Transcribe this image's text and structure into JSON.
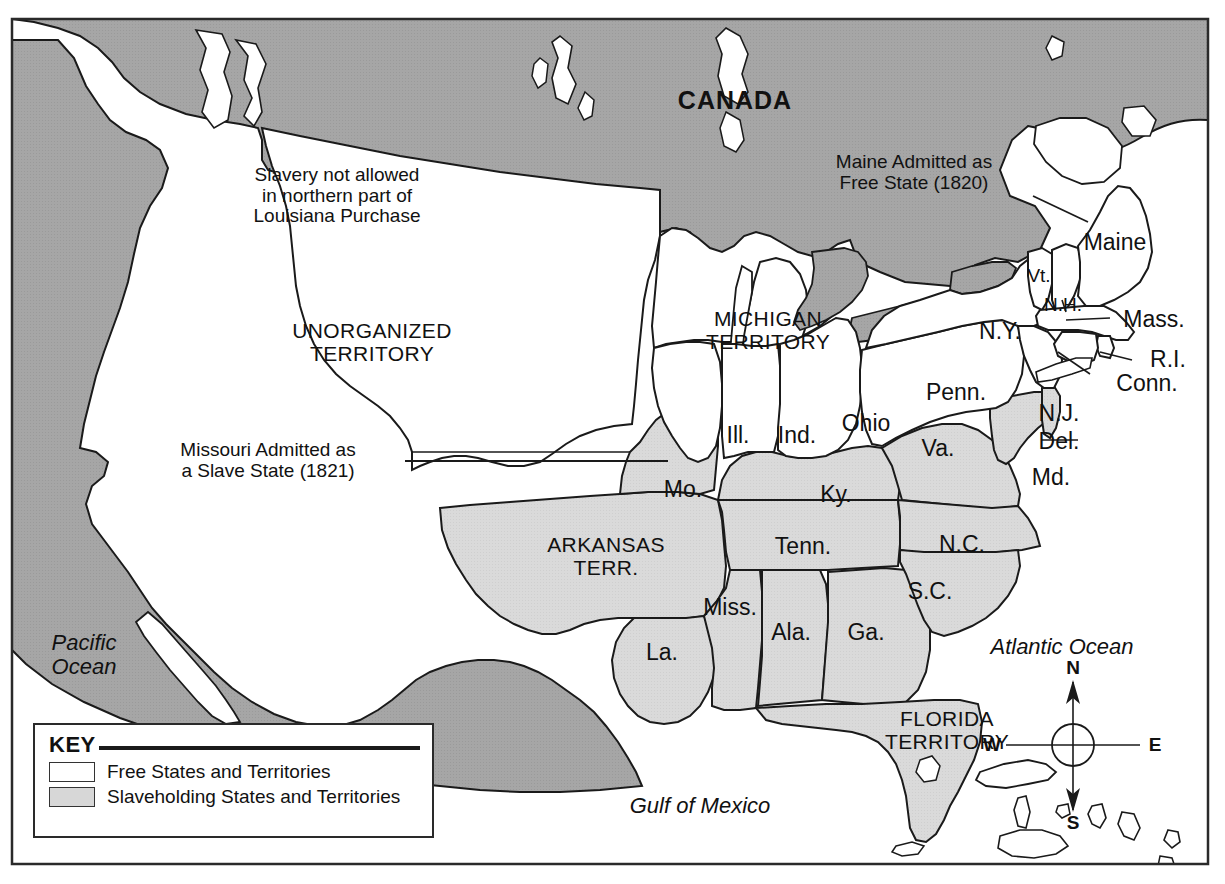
{
  "map": {
    "title_region": "United States 1820-1821 Missouri Compromise",
    "colors": {
      "free_fill": "#ffffff",
      "slave_fill": "#d7d7d7",
      "foreign_fill": "#a3a3a3",
      "water_fill": "#ffffff",
      "outline": "#1a1a1a"
    },
    "country_labels": [
      {
        "name": "canada",
        "text": "CANADA"
      }
    ],
    "ocean_labels": [
      {
        "name": "pacific-ocean",
        "text": "Pacific\nOcean"
      },
      {
        "name": "atlantic-ocean",
        "text": "Atlantic Ocean"
      },
      {
        "name": "gulf-of-mexico",
        "text": "Gulf of Mexico"
      }
    ],
    "territory_labels": [
      {
        "name": "unorganized-territory",
        "text": "UNORGANIZED\nTERRITORY"
      },
      {
        "name": "michigan-territory",
        "text": "MICHIGAN\nTERRITORY"
      },
      {
        "name": "arkansas-territory",
        "text": "ARKANSAS\nTERR."
      },
      {
        "name": "florida-territory",
        "text": "FLORIDA\nTERRITORY"
      }
    ],
    "state_labels": [
      {
        "name": "missouri",
        "text": "Mo."
      },
      {
        "name": "illinois",
        "text": "Ill."
      },
      {
        "name": "indiana",
        "text": "Ind."
      },
      {
        "name": "ohio",
        "text": "Ohio"
      },
      {
        "name": "kentucky",
        "text": "Ky."
      },
      {
        "name": "virginia",
        "text": "Va."
      },
      {
        "name": "pennsylvania",
        "text": "Penn."
      },
      {
        "name": "new-york",
        "text": "N.Y."
      },
      {
        "name": "vermont",
        "text": "Vt."
      },
      {
        "name": "new-hampshire",
        "text": "N.H."
      },
      {
        "name": "maine",
        "text": "Maine"
      },
      {
        "name": "massachusetts",
        "text": "Mass."
      },
      {
        "name": "rhode-island",
        "text": "R.I."
      },
      {
        "name": "connecticut",
        "text": "Conn."
      },
      {
        "name": "new-jersey",
        "text": "N.J."
      },
      {
        "name": "delaware",
        "text": "Del."
      },
      {
        "name": "maryland",
        "text": "Md."
      },
      {
        "name": "north-carolina",
        "text": "N.C."
      },
      {
        "name": "south-carolina",
        "text": "S.C."
      },
      {
        "name": "tennessee",
        "text": "Tenn."
      },
      {
        "name": "georgia",
        "text": "Ga."
      },
      {
        "name": "alabama",
        "text": "Ala."
      },
      {
        "name": "mississippi",
        "text": "Miss."
      },
      {
        "name": "louisiana",
        "text": "La."
      }
    ],
    "callouts": [
      {
        "name": "slavery-not-allowed-note",
        "text": "Slavery not allowed\nin northern part of\nLouisiana Purchase"
      },
      {
        "name": "maine-admitted-note",
        "text": "Maine Admitted as\nFree State (1820)"
      },
      {
        "name": "missouri-admitted-note",
        "text": "Missouri Admitted as\na Slave State (1821)"
      }
    ],
    "compass": {
      "north": "N",
      "south": "S",
      "east": "E",
      "west": "W"
    }
  },
  "key": {
    "title": "KEY",
    "entries": [
      {
        "name": "free-states",
        "label": "Free States and Territories",
        "swatch": "#ffffff"
      },
      {
        "name": "slaveholding-states",
        "label": "Slaveholding States and Territories",
        "swatch": "#d7d7d7"
      }
    ]
  }
}
